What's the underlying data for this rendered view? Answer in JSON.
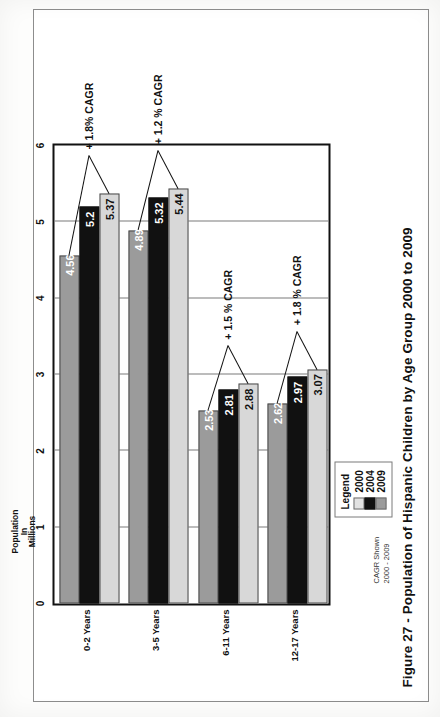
{
  "figure": {
    "caption": "Figure 27 - Population of Hispanic Children by Age Group 2000 to 2009"
  },
  "legend": {
    "title": "Legend",
    "items": [
      {
        "label": "2000",
        "color": "#e2e2e2"
      },
      {
        "label": "2004",
        "color": "#111111"
      },
      {
        "label": "2009",
        "color": "#9b9b9b"
      }
    ]
  },
  "note": {
    "line1": "CAGR Shown",
    "line2": "2000 - 2009"
  },
  "chart_data": {
    "type": "bar",
    "orientation": "horizontal",
    "title": "Figure 27 - Population of Hispanic Children by Age Group 2000 to 2009",
    "xlabel": "",
    "ylabel": "Population In Millions",
    "axis_title_lines": [
      "Population",
      "In",
      "Millions"
    ],
    "xlim": [
      0,
      6
    ],
    "ticks": [
      "0",
      "1",
      "2",
      "3",
      "4",
      "5",
      "6"
    ],
    "grid": true,
    "legend_position": "bottom-right",
    "categories": [
      "0-2 Years",
      "3-5 Years",
      "6-11 Years",
      "12-17 Years"
    ],
    "series": [
      {
        "name": "2000",
        "color": "#9b9b9b",
        "values": [
          4.56,
          4.89,
          2.53,
          2.62
        ],
        "labels": [
          "4.56",
          "4.89",
          "2.53",
          "2.62"
        ]
      },
      {
        "name": "2004",
        "color": "#111111",
        "values": [
          5.2,
          5.32,
          2.81,
          2.97
        ],
        "labels": [
          "5.2",
          "5.32",
          "2.81",
          "2.97"
        ]
      },
      {
        "name": "2009",
        "color": "#d8d8d8",
        "values": [
          5.37,
          5.44,
          2.88,
          3.07
        ],
        "labels": [
          "5.37",
          "5.44",
          "2.88",
          "3.07"
        ]
      }
    ],
    "annotations": [
      {
        "category": "0-2 Years",
        "text": "+ 1.8% CAGR"
      },
      {
        "category": "3-5 Years",
        "text": "+ 1.2 % CAGR"
      },
      {
        "category": "6-11 Years",
        "text": "+ 1.5 % CAGR"
      },
      {
        "category": "12-17 Years",
        "text": "+ 1.8 % CAGR"
      }
    ]
  }
}
